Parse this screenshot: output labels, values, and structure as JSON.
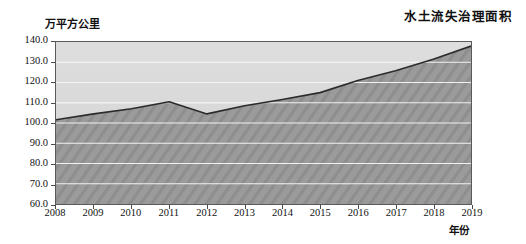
{
  "chart_data": {
    "type": "area",
    "title": "水土流失治理面积",
    "xlabel": "年份",
    "ylabel": "万平方公里",
    "categories": [
      "2008",
      "2009",
      "2010",
      "2011",
      "2012",
      "2013",
      "2014",
      "2015",
      "2016",
      "2017",
      "2018",
      "2019"
    ],
    "values": [
      101.6,
      104.5,
      107.0,
      110.5,
      104.5,
      108.5,
      111.6,
      115.0,
      121.0,
      125.8,
      131.5,
      138.0
    ],
    "ylim": [
      60.0,
      140.0
    ],
    "ytick_labels": [
      "140.0",
      "130.0",
      "120.0",
      "110.0",
      "100.0",
      "90.0",
      "80.0",
      "70.0",
      "60.0"
    ],
    "ytick_values": [
      140.0,
      130.0,
      120.0,
      110.0,
      100.0,
      90.0,
      80.0,
      70.0,
      60.0
    ],
    "grid": true,
    "legend": "none",
    "series_name": "水土流失治理面积",
    "colors": {
      "area_fill": "#9a9a9a",
      "plot_background": "#d8d8d8",
      "line": "#2b2b2b",
      "gridline": "#f2f2f2",
      "axis": "#5a5a5a",
      "text": "#111111"
    }
  }
}
